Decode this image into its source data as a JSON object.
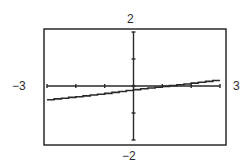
{
  "chart_data": {
    "type": "line",
    "title": "",
    "xlabel": "",
    "ylabel": "",
    "xlim": [
      -3,
      3
    ],
    "ylim": [
      -2,
      2
    ],
    "tick_labels": {
      "xmin": "−3",
      "xmax": "3",
      "ymin": "−2",
      "ymax": "2"
    },
    "x_ticks": [
      -3,
      -2,
      -1,
      0,
      1,
      2,
      3
    ],
    "y_ticks": [
      -2,
      -1,
      0,
      1,
      2
    ],
    "grid": false,
    "legend": null,
    "series": [
      {
        "name": "graph",
        "style": "stepped calculator line",
        "x": [
          -3,
          -2,
          -1,
          0,
          1,
          2,
          3
        ],
        "y": [
          -0.52,
          -0.41,
          -0.29,
          -0.15,
          -0.03,
          0.09,
          0.22
        ]
      }
    ],
    "color": "#2a2a2a"
  }
}
